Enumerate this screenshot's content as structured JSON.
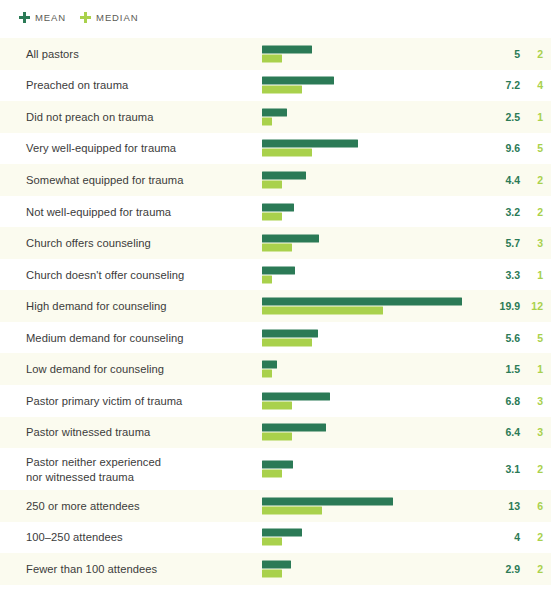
{
  "legend": {
    "items": [
      {
        "label": "MEAN",
        "color": "#2b7a56",
        "icon": "plus-marker-icon"
      },
      {
        "label": "MEDIAN",
        "color": "#a9d14c",
        "icon": "plus-marker-icon"
      }
    ]
  },
  "colors": {
    "mean": "#2b7a56",
    "median": "#a9d14c",
    "stripe": "#fbfbef",
    "background": "#ffffff",
    "label_text": "#3b3b3b",
    "legend_text": "#5b5b55"
  },
  "chart_data": {
    "type": "bar",
    "title": "",
    "subtitle": "",
    "xlabel": "",
    "ylabel": "",
    "orientation": "horizontal",
    "grid": false,
    "legend_position": "top-left",
    "xlim": [
      0,
      19.9
    ],
    "px_per_unit": 10.05,
    "categories": [
      "All pastors",
      "Preached on trauma",
      "Did not preach on trauma",
      "Very well-equipped for trauma",
      "Somewhat equipped for trauma",
      "Not well-equipped for trauma",
      "Church offers counseling",
      "Church doesn't offer counseling",
      "High demand for counseling",
      "Medium demand for counseling",
      "Low demand for counseling",
      "Pastor primary victim of trauma",
      "Pastor witnessed trauma",
      "Pastor neither experienced\nnor witnessed trauma",
      "250 or more attendees",
      "100–250 attendees",
      "Fewer than 100 attendees"
    ],
    "series": [
      {
        "name": "MEAN",
        "color": "#2b7a56",
        "values": [
          5,
          7.2,
          2.5,
          9.6,
          4.4,
          3.2,
          5.7,
          3.3,
          19.9,
          5.6,
          1.5,
          6.8,
          6.4,
          3.1,
          13,
          4,
          2.9
        ]
      },
      {
        "name": "MEDIAN",
        "color": "#a9d14c",
        "values": [
          2,
          4,
          1,
          5,
          2,
          2,
          3,
          1,
          12,
          5,
          1,
          3,
          3,
          2,
          6,
          2,
          2
        ]
      }
    ],
    "value_labels": {
      "mean": [
        "5",
        "7.2",
        "2.5",
        "9.6",
        "4.4",
        "3.2",
        "5.7",
        "3.3",
        "19.9",
        "5.6",
        "1.5",
        "6.8",
        "6.4",
        "3.1",
        "13",
        "4",
        "2.9"
      ],
      "median": [
        "2",
        "4",
        "1",
        "5",
        "2",
        "2",
        "3",
        "1",
        "12",
        "5",
        "1",
        "3",
        "3",
        "2",
        "6",
        "2",
        "2"
      ]
    }
  }
}
